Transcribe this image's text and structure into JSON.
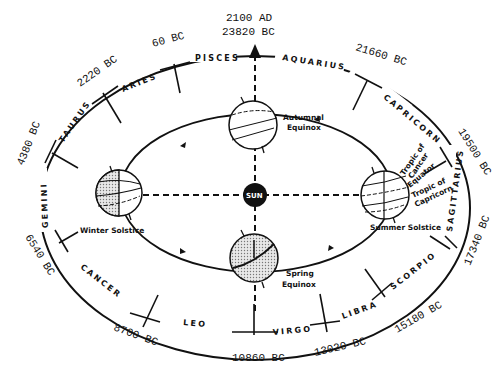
{
  "diagram": {
    "top_dates": {
      "line1": "2100 AD",
      "line2": "23820 BC"
    },
    "center": {
      "label": "SUN"
    },
    "zodiac": [
      {
        "name": "PISCES"
      },
      {
        "name": "AQUARIUS"
      },
      {
        "name": "CAPRICORN"
      },
      {
        "name": "SAGITTARIUS"
      },
      {
        "name": "SCORPIO"
      },
      {
        "name": "LIBRA"
      },
      {
        "name": "VIRGO"
      },
      {
        "name": "LEO"
      },
      {
        "name": "CANCER"
      },
      {
        "name": "GEMINI"
      },
      {
        "name": "TAURUS"
      },
      {
        "name": "ARIES"
      }
    ],
    "dates": [
      {
        "label": "21660 BC"
      },
      {
        "label": "19500 BC"
      },
      {
        "label": "17340 BC"
      },
      {
        "label": "15180 BC"
      },
      {
        "label": "13020 BC"
      },
      {
        "label": "10860 BC"
      },
      {
        "label": "8700 BC"
      },
      {
        "label": "6540 BC"
      },
      {
        "label": "4380 BC"
      },
      {
        "label": "2220 BC"
      },
      {
        "label": "60 BC"
      }
    ],
    "positions": {
      "autumnal": {
        "line1": "Autumnal",
        "line2": "Equinox"
      },
      "spring": {
        "line1": "Spring",
        "line2": "Equinox"
      },
      "winter": {
        "label": "Winter Solstice"
      },
      "summer": {
        "label": "Summer Solstice"
      }
    },
    "globe_labels": {
      "tropic_cancer": {
        "line1": "Tropic of",
        "line2": "Cancer"
      },
      "equator": "Equator",
      "tropic_capricorn": {
        "line1": "Tropic of",
        "line2": "Capricorn"
      }
    }
  }
}
